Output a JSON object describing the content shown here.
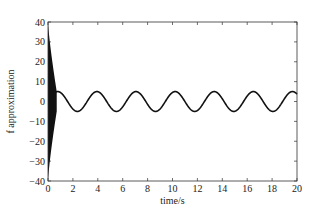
{
  "chart_data": {
    "type": "line",
    "title": "",
    "xlabel": "time/s",
    "ylabel": "f approximation",
    "xlim": [
      0,
      20
    ],
    "ylim": [
      -40,
      40
    ],
    "xticks": [
      0,
      2,
      4,
      6,
      8,
      10,
      12,
      14,
      16,
      18,
      20
    ],
    "yticks": [
      -40,
      -30,
      -20,
      -10,
      0,
      10,
      20,
      30,
      40
    ],
    "grid": false,
    "legend": null,
    "series": [
      {
        "name": "f approximation",
        "description": "High-frequency oscillation with envelope decaying from ±40 at t=0 to about ±5 by t≈0.7 s, then a steady sinusoid of amplitude ≈5 and period ≈π s (≈5·sin(2t))",
        "transient": {
          "t_start": 0,
          "t_end": 0.7,
          "envelope_start": 40,
          "envelope_end": 5
        },
        "steady_state": {
          "amplitude": 5,
          "angular_frequency": 2,
          "phase": 0
        },
        "peaks_t": [
          0.79,
          3.93,
          7.07,
          10.21,
          13.35,
          16.49,
          19.63
        ],
        "troughs_t": [
          2.36,
          5.5,
          8.64,
          11.78,
          14.92,
          18.06
        ]
      }
    ],
    "color": "#111111"
  }
}
